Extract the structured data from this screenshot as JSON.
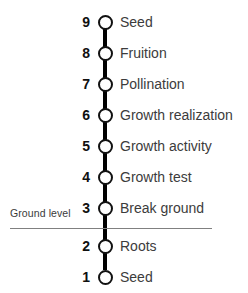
{
  "diagram": {
    "orientation": "vertical",
    "background_color": "#ffffff",
    "node_fill_color": "#ffffff",
    "node_stroke_color": "#111111",
    "stem_color": "#000000",
    "number_color": "#101010",
    "label_color": "#3c3c3c",
    "ground_line_color": "#808080",
    "ground": {
      "label": "Ground level",
      "at_step": "3"
    },
    "steps": [
      {
        "number": "9",
        "label": "Seed"
      },
      {
        "number": "8",
        "label": "Fruition"
      },
      {
        "number": "7",
        "label": "Pollination"
      },
      {
        "number": "6",
        "label": "Growth realization"
      },
      {
        "number": "5",
        "label": "Growth activity"
      },
      {
        "number": "4",
        "label": "Growth test"
      },
      {
        "number": "3",
        "label": "Break ground"
      },
      {
        "number": "2",
        "label": "Roots"
      },
      {
        "number": "1",
        "label": "Seed"
      }
    ]
  }
}
